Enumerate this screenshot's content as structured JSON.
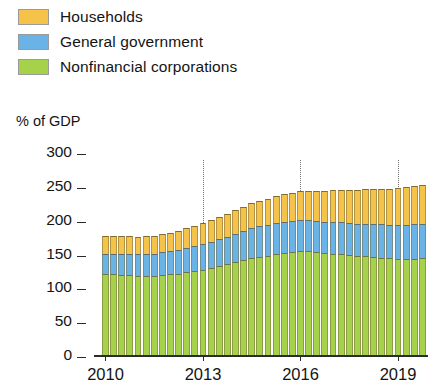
{
  "legend": {
    "items": [
      {
        "label": "Households",
        "color": "#f5c24a",
        "icon": "legend-swatch"
      },
      {
        "label": "General government",
        "color": "#69b3e7",
        "icon": "legend-swatch"
      },
      {
        "label": "Nonfinancial corporations",
        "color": "#a5d martin"
      }
    ]
  },
  "axis": {
    "unit_caption": "% of GDP",
    "y_ticks": [
      "300",
      "250",
      "200",
      "150",
      "100",
      "50",
      "0"
    ],
    "x_labels": [
      "2010",
      "2013",
      "2016",
      "2019"
    ]
  },
  "chart_data": {
    "type": "bar",
    "stacked": true,
    "title": "",
    "subtitle": "",
    "xlabel": "",
    "ylabel": "% of GDP",
    "ylim": [
      0,
      300
    ],
    "ytick_values": [
      0,
      50,
      100,
      150,
      200,
      250,
      300
    ],
    "grid": false,
    "gridlines_x_at": [
      "2013",
      "2016",
      "2019"
    ],
    "legend_position": "top-left",
    "categories": [
      "2010Q1",
      "2010Q2",
      "2010Q3",
      "2010Q4",
      "2011Q1",
      "2011Q2",
      "2011Q3",
      "2011Q4",
      "2012Q1",
      "2012Q2",
      "2012Q3",
      "2012Q4",
      "2013Q1",
      "2013Q2",
      "2013Q3",
      "2013Q4",
      "2014Q1",
      "2014Q2",
      "2014Q3",
      "2014Q4",
      "2015Q1",
      "2015Q2",
      "2015Q3",
      "2015Q4",
      "2016Q1",
      "2016Q2",
      "2016Q3",
      "2016Q4",
      "2017Q1",
      "2017Q2",
      "2017Q3",
      "2017Q4",
      "2018Q1",
      "2018Q2",
      "2018Q3",
      "2018Q4",
      "2019Q1",
      "2019Q2",
      "2019Q3",
      "2019Q4"
    ],
    "x_tick_categories": [
      "2010Q1",
      "2013Q1",
      "2016Q1",
      "2019Q1"
    ],
    "series": [
      {
        "name": "Nonfinancial corporations",
        "color": "#a5d24a",
        "values": [
          119,
          119,
          118,
          118,
          117,
          117,
          117,
          118,
          119,
          120,
          122,
          124,
          126,
          128,
          131,
          134,
          137,
          140,
          143,
          145,
          147,
          149,
          151,
          152,
          153,
          153,
          152,
          151,
          150,
          149,
          148,
          147,
          146,
          145,
          144,
          143,
          142,
          142,
          142,
          143
        ]
      },
      {
        "name": "General government",
        "color": "#69b3e7",
        "values": [
          31,
          31,
          32,
          32,
          32,
          33,
          33,
          34,
          34,
          35,
          36,
          37,
          38,
          39,
          40,
          41,
          42,
          43,
          44,
          45,
          45,
          46,
          46,
          46,
          46,
          46,
          46,
          46,
          47,
          47,
          47,
          47,
          48,
          48,
          49,
          49,
          50,
          50,
          51,
          51
        ]
      },
      {
        "name": "Households",
        "color": "#f5c24a",
        "values": [
          26,
          26,
          26,
          26,
          26,
          26,
          26,
          27,
          27,
          28,
          29,
          30,
          31,
          32,
          33,
          34,
          35,
          36,
          37,
          38,
          39,
          40,
          41,
          42,
          43,
          44,
          45,
          46,
          47,
          48,
          49,
          50,
          51,
          52,
          53,
          54,
          55,
          56,
          57,
          58
        ]
      }
    ],
    "totals": [
      176,
      176,
      176,
      176,
      175,
      176,
      176,
      179,
      180,
      183,
      187,
      191,
      195,
      199,
      204,
      209,
      214,
      219,
      224,
      228,
      231,
      235,
      238,
      240,
      242,
      243,
      243,
      243,
      244,
      244,
      244,
      244,
      245,
      245,
      246,
      246,
      247,
      248,
      250,
      252
    ]
  }
}
